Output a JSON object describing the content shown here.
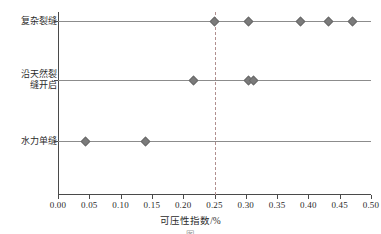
{
  "chart_data": {
    "type": "scatter",
    "title": "",
    "xlabel": "可压性指数/%",
    "ylabel": "",
    "xlim": [
      0.0,
      0.5
    ],
    "grid": false,
    "legend": "none",
    "xticks": [
      "0.00",
      "0.05",
      "0.10",
      "0.15",
      "0.20",
      "0.25",
      "0.30",
      "0.35",
      "0.40",
      "0.45",
      "0.50"
    ],
    "xtick_values": [
      0.0,
      0.05,
      0.1,
      0.15,
      0.2,
      0.25,
      0.3,
      0.35,
      0.4,
      0.45,
      0.5
    ],
    "categories": [
      "复杂裂缝",
      "沿天然裂\n缝开启",
      "水力单缝"
    ],
    "category_values": [
      {
        "name": "复杂裂缝",
        "values": [
          0.25,
          0.305,
          0.387,
          0.432,
          0.47
        ]
      },
      {
        "name": "沿天然裂缝开启",
        "values": [
          0.217,
          0.304,
          0.312
        ]
      },
      {
        "name": "水力单缝",
        "values": [
          0.044,
          0.14
        ]
      }
    ],
    "annotations": [
      {
        "type": "vline",
        "value": 0.25,
        "style": "dashed",
        "color": "#b08f8f"
      }
    ],
    "marker_color": "#7b7b7b",
    "marker_shape": "diamond",
    "baseline_color": "#8c8c8c",
    "axis_color": "#4a4a4a"
  },
  "caption": {
    "text": "图"
  }
}
